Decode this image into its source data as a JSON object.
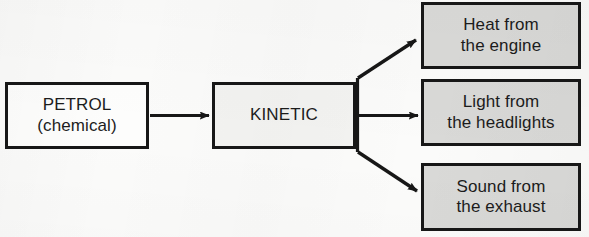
{
  "diagram": {
    "type": "flowchart",
    "background_color": "#fbfbfa",
    "line_color": "#171717",
    "nodes": [
      {
        "id": "petrol",
        "role": "source",
        "fill": "#fdfdfc",
        "line1": "PETROL",
        "line2": "(chemical)"
      },
      {
        "id": "kinetic",
        "role": "stage",
        "fill": "#f3f3f1",
        "line1": "KINETIC",
        "line2": ""
      },
      {
        "id": "heat",
        "role": "output",
        "fill": "#d9d9d7",
        "line1": "Heat from",
        "line2": "the engine"
      },
      {
        "id": "light",
        "role": "output",
        "fill": "#d9d9d7",
        "line1": "Light from",
        "line2": "the headlights"
      },
      {
        "id": "sound",
        "role": "output",
        "fill": "#d9d9d7",
        "line1": "Sound from",
        "line2": "the exhaust"
      }
    ],
    "edges": [
      {
        "id": "petrol-to-kinetic",
        "from": "petrol",
        "to": "kinetic",
        "style": "straight-arrow"
      },
      {
        "id": "kinetic-to-heat",
        "from": "kinetic",
        "to": "heat",
        "style": "branch-arrow-up"
      },
      {
        "id": "kinetic-to-light",
        "from": "kinetic",
        "to": "light",
        "style": "branch-arrow-straight"
      },
      {
        "id": "kinetic-to-sound",
        "from": "kinetic",
        "to": "sound",
        "style": "branch-arrow-down"
      }
    ]
  }
}
